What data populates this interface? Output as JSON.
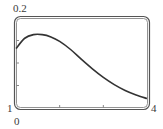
{
  "labels": {
    "y_max": "0.2",
    "x_min": "1",
    "y_min": "0",
    "x_max": "4"
  },
  "chart_data": {
    "type": "line",
    "title": "",
    "xlabel": "",
    "ylabel": "",
    "xlim": [
      1,
      4
    ],
    "ylim": [
      0,
      0.2
    ],
    "x_ticks": [
      2,
      3
    ],
    "y_ticks": [
      0.05,
      0.1,
      0.15
    ],
    "grid": false,
    "legend": null,
    "series": [
      {
        "name": "f(x)",
        "x": [
          1.0,
          1.2,
          1.4,
          1.6,
          1.8,
          2.0,
          2.25,
          2.5,
          2.75,
          3.0,
          3.25,
          3.5,
          3.75,
          4.0
        ],
        "values": [
          0.132,
          0.155,
          0.163,
          0.163,
          0.158,
          0.148,
          0.13,
          0.108,
          0.087,
          0.068,
          0.052,
          0.039,
          0.029,
          0.021
        ]
      }
    ],
    "colors": {
      "curve": "#333333",
      "frame": "#555555"
    }
  }
}
